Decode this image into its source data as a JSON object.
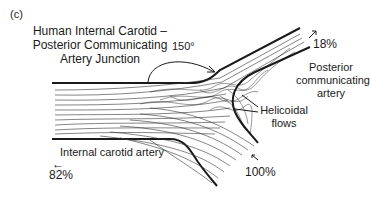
{
  "panel_label": "(c)",
  "title": {
    "line1": "Human Internal Carotid –",
    "line2": "Posterior Communicating",
    "line3": "Artery Junction"
  },
  "angle_label": "150°",
  "labels": {
    "pcom_line1": "Posterior",
    "pcom_line2": "communicating",
    "pcom_line3": "artery",
    "helicoidal_line1": "Helicoidal",
    "helicoidal_line2": "flows",
    "ica": "Internal carotid artery"
  },
  "flows": {
    "outflow_pcom": "18%",
    "outflow_ica": "82%",
    "inflow": "100%",
    "arrow_left": "←"
  },
  "colors": {
    "ink": "#1a1a1a",
    "background": "#ffffff"
  }
}
